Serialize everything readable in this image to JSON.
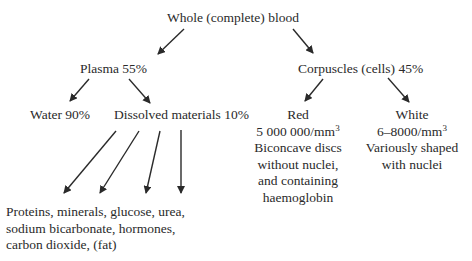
{
  "diagram": {
    "root": "Whole (complete) blood",
    "plasma": {
      "label": "Plasma 55%",
      "water": "Water 90%",
      "dissolved": "Dissolved materials 10%",
      "contents": [
        "Proteins, minerals, glucose, urea,",
        "sodium bicarbonate, hormones,",
        "carbon dioxide, (fat)"
      ]
    },
    "corpuscles": {
      "label": "Corpuscles (cells) 45%",
      "red": {
        "title": "Red",
        "count": "5 000 000/mm",
        "count_exp": "3",
        "desc": [
          "Biconcave discs",
          "without nuclei,",
          "and containing",
          "haemoglobin"
        ]
      },
      "white": {
        "title": "White",
        "count": "6–8000/mm",
        "count_exp": "3",
        "desc": [
          "Variously shaped",
          "with nuclei"
        ]
      }
    }
  }
}
